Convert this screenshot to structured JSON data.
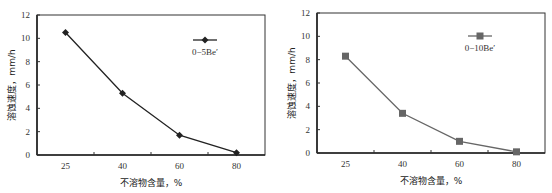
{
  "chart_data": [
    {
      "type": "line",
      "title": "",
      "categories": [
        "25",
        "40",
        "60",
        "80"
      ],
      "series": [
        {
          "name": "0−5Be′",
          "values": [
            10.5,
            5.3,
            1.7,
            0.2
          ],
          "marker": "diamond",
          "color": "#222222"
        }
      ],
      "xlabel": "不溶物含量，%",
      "ylabel": "溶蚀速度，mm/h",
      "ylim": [
        0,
        12
      ],
      "yticks": [
        "0",
        "2",
        "4",
        "6",
        "8",
        "10",
        "12"
      ],
      "grid": false,
      "legend_position": "upper right"
    },
    {
      "type": "line",
      "title": "",
      "categories": [
        "25",
        "40",
        "60",
        "80"
      ],
      "series": [
        {
          "name": "0−10Be′",
          "values": [
            8.3,
            3.4,
            1.0,
            0.1
          ],
          "marker": "square",
          "color": "#666666"
        }
      ],
      "xlabel": "不溶物含量，%",
      "ylabel": "溶蚀速度，mm/h",
      "ylim": [
        0,
        12
      ],
      "yticks": [
        "0",
        "2",
        "4",
        "6",
        "8",
        "10",
        "12"
      ],
      "grid": false,
      "legend_position": "upper right"
    }
  ]
}
